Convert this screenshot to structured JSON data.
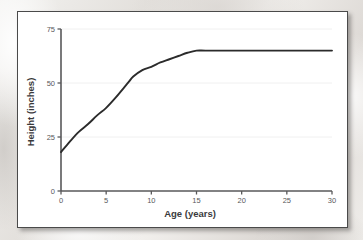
{
  "figure": {
    "background_color": "#ffffff",
    "border_color": "#4a4a4a",
    "line_color": "#2b2b2b",
    "grid_color": "#f0f0f0",
    "axis_color": "#58585a",
    "tick_text_color": "#58585a"
  },
  "chart_data": {
    "type": "line",
    "title": "",
    "xlabel": "Age (years)",
    "ylabel": "Height (inches)",
    "xlim": [
      0,
      30
    ],
    "ylim": [
      0,
      75
    ],
    "xticks": [
      0,
      5,
      10,
      15,
      20,
      25,
      30
    ],
    "xtick_labels": [
      "0",
      "5",
      "10",
      "15",
      "20",
      "25",
      "30"
    ],
    "yticks": [
      0,
      25,
      50,
      75
    ],
    "ytick_labels": [
      "0",
      "25",
      "50",
      "75"
    ],
    "grid": true,
    "grid_axis": "y",
    "legend": false,
    "series": [
      {
        "name": "Height",
        "x": [
          0,
          1,
          2,
          3,
          4,
          5,
          6,
          7,
          7.5,
          8,
          9,
          10,
          11,
          12,
          13,
          14,
          15,
          16,
          18,
          20,
          22,
          25,
          28,
          30
        ],
        "values": [
          18,
          23,
          27.5,
          31,
          35,
          38.5,
          43,
          48,
          50.5,
          53,
          56,
          57.5,
          59.5,
          61,
          62.5,
          64,
          65,
          65,
          65,
          65,
          65,
          65,
          65,
          65
        ]
      }
    ]
  }
}
